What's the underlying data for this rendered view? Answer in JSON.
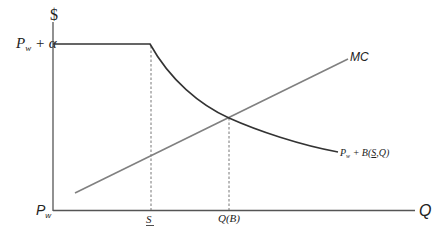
{
  "diagram": {
    "type": "economics-supply-demand-diagram",
    "y_axis": {
      "label": "$",
      "ticks": [
        {
          "name": "pw-plus-alpha",
          "main": "P",
          "sub": "w",
          "suffix": " + α"
        },
        {
          "name": "pw",
          "main": "P",
          "sub": "w"
        }
      ]
    },
    "x_axis": {
      "label": "Q",
      "ticks": [
        {
          "name": "s-underline",
          "label": "S"
        },
        {
          "name": "q-of-b",
          "label": "Q(B)"
        }
      ]
    },
    "curves": [
      {
        "name": "marginal-cost",
        "label": "MC",
        "color": "#808080"
      },
      {
        "name": "price-curve",
        "label_main": "P",
        "label_sub": "w",
        "label_rest": " + B(",
        "label_s": "S",
        "label_end": ",Q)",
        "color": "#333333"
      }
    ],
    "colors": {
      "axis": "#555555",
      "dashed": "#666666"
    }
  }
}
